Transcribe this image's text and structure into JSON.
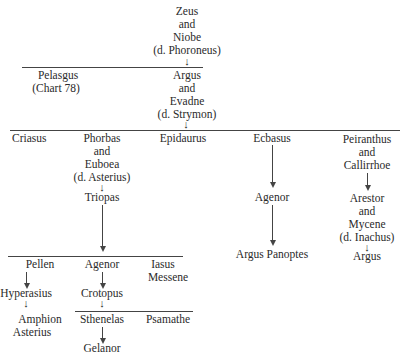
{
  "gen0": {
    "l1": "Zeus",
    "l2": "and",
    "l3": "Niobe",
    "l4": "(d. Phoroneus)"
  },
  "gen1": {
    "pelasgus": {
      "name": "Pelasgus",
      "note": "(Chart 78)"
    },
    "argus": {
      "l1": "Argus",
      "l2": "and",
      "l3": "Evadne",
      "l4": "(d. Strymon)"
    }
  },
  "gen2": {
    "criasus": "Criasus",
    "phorbas": {
      "l1": "Phorbas",
      "l2": "and",
      "l3": "Euboea",
      "l4": "(d. Asterius)"
    },
    "triopas": "Triopas",
    "epidaurus": "Epidaurus",
    "ecbasus": "Ecbasus",
    "agenor_e": "Agenor",
    "argus_panoptes": "Argus Panoptes",
    "peiranthus": {
      "l1": "Peiranthus",
      "l2": "and",
      "l3": "Callirrhoe"
    },
    "arestor": {
      "l1": "Arestor",
      "l2": "and",
      "l3": "Mycene",
      "l4": "(d. Inachus)"
    },
    "argus_p": "Argus"
  },
  "gen3": {
    "pellen": "Pellen",
    "agenor": "Agenor",
    "iasus": "Iasus",
    "messene": "Messene",
    "hyperasius": "Hyperasius",
    "crotopus": "Crotopus",
    "amphion": "Amphion",
    "asterius": "Asterius",
    "sthenelas": "Sthenelas",
    "psamathe": "Psamathe",
    "gelanor": "Gelanor"
  },
  "arrow_glyph": "↓"
}
